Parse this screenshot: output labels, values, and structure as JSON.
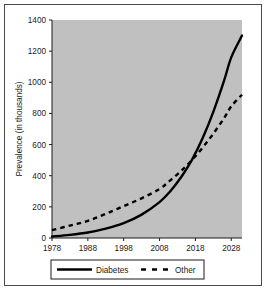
{
  "figure": {
    "background_color": "#ffffff",
    "frame_color": "#4a4a4a",
    "plot_background_color": "#c0c0c0",
    "line_color": "#000000"
  },
  "chart_data": {
    "type": "line",
    "title": "",
    "subtitle": "",
    "xlabel": "",
    "ylabel": "Prevalence (in thousands)",
    "xlim": [
      1978,
      2031
    ],
    "ylim": [
      0,
      1400
    ],
    "ytick_labels": [
      "0",
      "200",
      "400",
      "600",
      "800",
      "1000",
      "1200",
      "1400"
    ],
    "ytick_values": [
      0,
      200,
      400,
      600,
      800,
      1000,
      1200,
      1400
    ],
    "xtick_labels": [
      "1978",
      "1988",
      "1998",
      "2008",
      "2018",
      "2028"
    ],
    "xtick_values": [
      1978,
      1988,
      1998,
      2008,
      2018,
      2028
    ],
    "grid": false,
    "legend_position": "below-axis",
    "series": [
      {
        "name": "Diabetes",
        "style": "solid",
        "color": "#000000",
        "x": [
          1978,
          1983,
          1988,
          1993,
          1998,
          2003,
          2008,
          2011,
          2014,
          2017,
          2020,
          2023,
          2026,
          2028,
          2031
        ],
        "values": [
          10,
          20,
          35,
          60,
          95,
          150,
          230,
          300,
          390,
          500,
          640,
          810,
          1010,
          1160,
          1300
        ]
      },
      {
        "name": "Other",
        "style": "dashed",
        "color": "#000000",
        "x": [
          1978,
          1983,
          1988,
          1993,
          1998,
          2003,
          2008,
          2011,
          2014,
          2017,
          2020,
          2023,
          2026,
          2028,
          2031
        ],
        "values": [
          50,
          80,
          110,
          155,
          205,
          255,
          315,
          370,
          430,
          500,
          580,
          670,
          770,
          845,
          920
        ]
      }
    ],
    "annotations": []
  },
  "legend": {
    "items": [
      {
        "label": "Diabetes",
        "style": "solid"
      },
      {
        "label": "Other",
        "style": "dashed"
      }
    ]
  }
}
